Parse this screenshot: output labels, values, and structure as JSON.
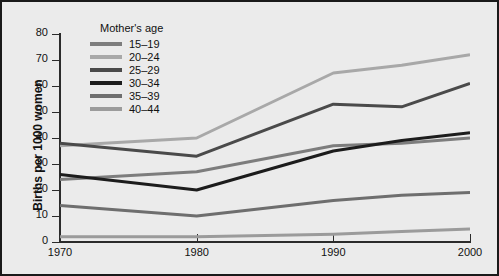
{
  "chart_data": {
    "type": "line",
    "title": "",
    "xlabel": "",
    "ylabel": "Births per 1000 women",
    "legend_title": "Mother's age",
    "legend_position": "top-left-inside",
    "grid": false,
    "x": [
      1970,
      1980,
      1990,
      1995,
      2000
    ],
    "xtick_labels": [
      "1970",
      "1980",
      "1990",
      "2000"
    ],
    "xtick_values": [
      1970,
      1980,
      1990,
      2000
    ],
    "xlim": [
      1970,
      2000
    ],
    "ylim": [
      0,
      80
    ],
    "ytick_labels": [
      "0",
      "10",
      "20",
      "30",
      "40",
      "50",
      "60",
      "70",
      "80"
    ],
    "ytick_values": [
      0,
      10,
      20,
      30,
      40,
      50,
      60,
      70,
      80
    ],
    "series": [
      {
        "name": "15-19",
        "color": "#7d7d7d",
        "values": [
          24,
          27,
          37,
          38,
          40
        ]
      },
      {
        "name": "20-24",
        "color": "#a8a8a8",
        "values": [
          37,
          40,
          65,
          68,
          72
        ]
      },
      {
        "name": "25-29",
        "color": "#4a4a4a",
        "values": [
          38,
          33,
          53,
          52,
          61
        ]
      },
      {
        "name": "30-34",
        "color": "#1c1c1c",
        "values": [
          26,
          20,
          35,
          39,
          42
        ]
      },
      {
        "name": "35-39",
        "color": "#6e6e6e",
        "values": [
          14,
          10,
          16,
          18,
          19
        ]
      },
      {
        "name": "40-44",
        "color": "#9b9b9b",
        "values": [
          2,
          2,
          3,
          4,
          5
        ]
      }
    ]
  },
  "axes": {
    "ylabel": "Births per 1000 women"
  },
  "legend": {
    "title": "Mother's age",
    "items": [
      {
        "label": "15-19"
      },
      {
        "label": "20-24"
      },
      {
        "label": "25-29"
      },
      {
        "label": "30-34"
      },
      {
        "label": "35-39"
      },
      {
        "label": "40-44"
      }
    ]
  }
}
